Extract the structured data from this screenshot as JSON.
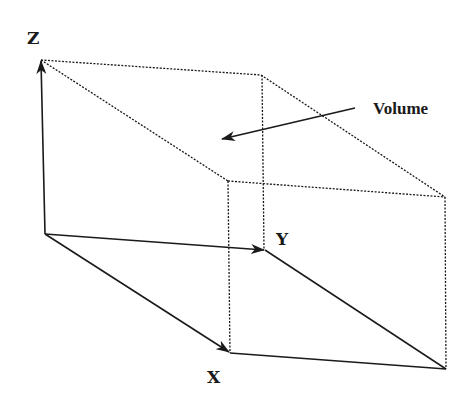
{
  "diagram": {
    "title": "Volume",
    "labels": {
      "z": "Z",
      "y": "Y",
      "x": "X",
      "volume": "Volume"
    },
    "colors": {
      "line": "#1a1a1a",
      "background": "#ffffff"
    },
    "vertices": {
      "origin": [
        45,
        234
      ],
      "z_top": [
        41,
        60
      ],
      "back_top_right": [
        261,
        75
      ],
      "y_end": [
        265,
        250
      ],
      "x_end": [
        230,
        353
      ],
      "front_top_left": [
        228,
        181
      ],
      "front_top_right": [
        445,
        197
      ],
      "front_bottom_right": [
        446,
        369
      ]
    },
    "axes": [
      {
        "name": "Z",
        "from": "origin",
        "to": "z_top",
        "style": "solid-arrow"
      },
      {
        "name": "Y",
        "from": "origin",
        "to": "y_end",
        "style": "solid-arrow"
      },
      {
        "name": "X",
        "from": "origin",
        "to": "x_end",
        "style": "solid-arrow"
      }
    ],
    "volume_pointer": {
      "from": [
        355,
        108
      ],
      "to": [
        222,
        139
      ]
    }
  }
}
